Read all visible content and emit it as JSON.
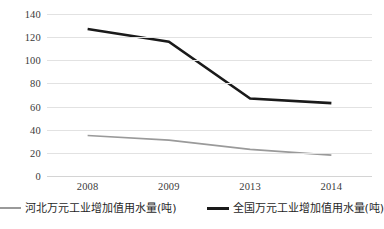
{
  "chart_data": {
    "type": "line",
    "title": "",
    "xlabel": "",
    "ylabel": "",
    "categories": [
      "2008",
      "2009",
      "2013",
      "2014"
    ],
    "ylim": [
      0,
      140
    ],
    "yticks": [
      0,
      20,
      40,
      60,
      80,
      100,
      120,
      140
    ],
    "ytick_labels": [
      "0",
      "20",
      "40",
      "60",
      "80",
      "100",
      "120",
      "140"
    ],
    "grid": "horizontal",
    "legend_position": "bottom",
    "series": [
      {
        "name": "河北万元工业增加值用水量(吨)",
        "values": [
          35,
          31,
          23,
          18
        ],
        "color": "#9a9a9a",
        "width": 1.6
      },
      {
        "name": "全国万元工业增加值用水量(吨)",
        "values": [
          127,
          116,
          67,
          63
        ],
        "color": "#1a1a1a",
        "width": 2.6
      }
    ]
  },
  "legend": {
    "items": [
      {
        "label": "河北万元工业增加值用水量(吨)",
        "swatch": "line-swatch-hebei"
      },
      {
        "label": "全国万元工业增加值用水量(吨)",
        "swatch": "line-swatch-national"
      }
    ]
  },
  "colors": {
    "gridline": "#e2e2e2",
    "baseline": "#d4d4d4",
    "background": "#ffffff",
    "text": "#2b2b2b"
  }
}
